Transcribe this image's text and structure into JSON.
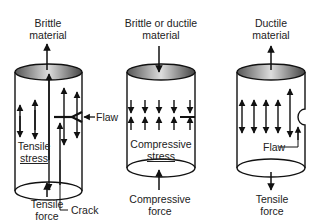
{
  "panels": [
    {
      "id": "brittle-tension",
      "title_line1": "Brittle",
      "title_line2": "material",
      "bottom_line1": "Tensile",
      "bottom_line2": "force",
      "stress_line1": "Tensile",
      "stress_line2": "stress",
      "callouts": {
        "flaw": "Flaw",
        "crack": "Crack"
      }
    },
    {
      "id": "compression",
      "title_line1": "Brittle or ductile",
      "title_line2": "material",
      "bottom_line1": "Compressive",
      "bottom_line2": "force",
      "stress_line1": "Compressive",
      "stress_line2": "stress"
    },
    {
      "id": "ductile-tension",
      "title_line1": "Ductile",
      "title_line2": "material",
      "bottom_line1": "Tensile",
      "bottom_line2": "force",
      "callouts": {
        "flaw": "Flaw"
      }
    }
  ]
}
